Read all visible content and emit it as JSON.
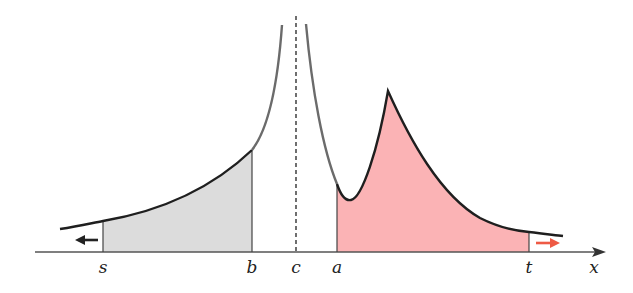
{
  "diagram": {
    "type": "improper-integral-illustration",
    "axis_label": "x",
    "points": [
      {
        "name": "s",
        "label": "s",
        "x": 103
      },
      {
        "name": "b",
        "label": "b",
        "x": 252
      },
      {
        "name": "c",
        "label": "c",
        "x": 296
      },
      {
        "name": "a",
        "label": "a",
        "x": 337
      },
      {
        "name": "t",
        "label": "t",
        "x": 529
      }
    ],
    "regions": [
      {
        "name": "left-shaded-region",
        "from": "s",
        "to": "b",
        "color": "#dcdcdc"
      },
      {
        "name": "right-shaded-region",
        "from": "a",
        "to": "t",
        "color": "#fbb3b5"
      }
    ],
    "arrows": [
      {
        "name": "left-arrow",
        "direction": "left",
        "color": "#222222"
      },
      {
        "name": "right-arrow",
        "direction": "right",
        "color": "#ee5a45"
      }
    ],
    "asymptote": {
      "at": "c",
      "style": "dashed"
    },
    "colors": {
      "curve": "#1f1f1f",
      "curve_faded": "#6b6b6b",
      "gray_fill": "#dcdcdc",
      "pink_fill": "#fbb3b5",
      "axis": "#555555",
      "accent_arrow": "#ee5a45"
    }
  }
}
